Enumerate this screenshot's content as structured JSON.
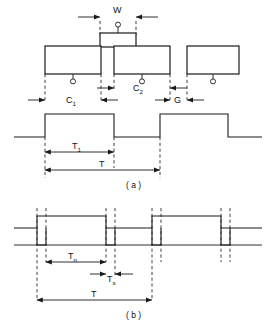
{
  "figure": {
    "panels": [
      {
        "id": "a",
        "caption": "( a )",
        "description": "Upper geometry of conductor blocks with gap, and corresponding rectangular pulse waveform",
        "geometry_labels": [
          {
            "name": "w-label",
            "text": "W",
            "meaning": "narrow center block width"
          },
          {
            "name": "c1-label",
            "text": "C",
            "subscript": "1",
            "meaning": "first conductor length"
          },
          {
            "name": "c2-label",
            "text": "C",
            "subscript": "2",
            "meaning": "second conductor length"
          },
          {
            "name": "g-label",
            "text": "G",
            "meaning": "gap width"
          }
        ],
        "waveform_labels": [
          {
            "name": "t1-label",
            "text": "T",
            "subscript": "1",
            "meaning": "pulse high duration"
          },
          {
            "name": "period-label",
            "text": "T",
            "meaning": "full period"
          }
        ]
      },
      {
        "id": "b",
        "caption": "( b )",
        "description": "Lower waveform showing narrow sampling spikes superimposed on wide pulses",
        "waveform_labels": [
          {
            "name": "tn-label",
            "text": "T",
            "subscript": "n",
            "meaning": "narrow interval"
          },
          {
            "name": "ts-label",
            "text": "T",
            "subscript": "s",
            "meaning": "spike width"
          },
          {
            "name": "period-label",
            "text": "T",
            "meaning": "full period"
          }
        ]
      }
    ],
    "colors": {
      "line": "#1a1a1a",
      "dashed": "#2b2b2b",
      "background": "#ffffff",
      "text": "#111111"
    }
  }
}
